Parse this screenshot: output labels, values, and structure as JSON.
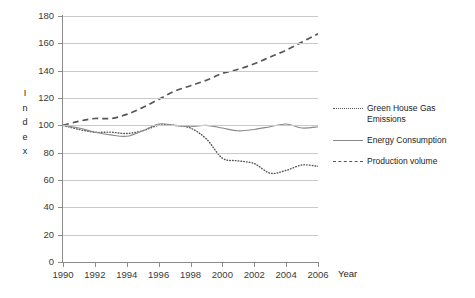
{
  "chart_data": {
    "type": "line",
    "title": "",
    "xlabel": "Year",
    "ylabel": "Index",
    "ylim": [
      0,
      180
    ],
    "xlim": [
      1990,
      2006
    ],
    "yticks": [
      0,
      20,
      40,
      60,
      80,
      100,
      120,
      140,
      160,
      180
    ],
    "xticks": [
      1990,
      1992,
      1994,
      1996,
      1998,
      2000,
      2002,
      2004,
      2006
    ],
    "grid": "horizontal",
    "legend_position": "right",
    "x": [
      1990,
      1991,
      1992,
      1993,
      1994,
      1995,
      1996,
      1997,
      1998,
      1999,
      2000,
      2001,
      2002,
      2003,
      2004,
      2005,
      2006
    ],
    "series": [
      {
        "name": "Green House Gas Emissions",
        "style": "dotted",
        "color": "#555555",
        "values": [
          100,
          97,
          95,
          95,
          94,
          96,
          100,
          100,
          98,
          90,
          76,
          74,
          72,
          65,
          67,
          71,
          70
        ]
      },
      {
        "name": "Energy Consumption",
        "style": "solid",
        "color": "#8a8a8a",
        "values": [
          100,
          98,
          95,
          93,
          92,
          96,
          101,
          100,
          99,
          100,
          98,
          96,
          97,
          99,
          101,
          98,
          99
        ]
      },
      {
        "name": "Production volume",
        "style": "dashed",
        "color": "#555555",
        "values": [
          100,
          103,
          105,
          105,
          108,
          113,
          119,
          125,
          129,
          133,
          138,
          141,
          145,
          150,
          155,
          161,
          167
        ]
      }
    ]
  },
  "axis": {
    "ylabel_letters": [
      "I",
      "n",
      "d",
      "e",
      "x"
    ],
    "xlabel": "Year"
  },
  "legend": {
    "items": [
      {
        "label": "Green House Gas Emissions",
        "key": "dotted-line-key"
      },
      {
        "label": "Energy Consumption",
        "key": "solid-line-key"
      },
      {
        "label": "Production volume",
        "key": "dashed-line-key"
      }
    ]
  }
}
